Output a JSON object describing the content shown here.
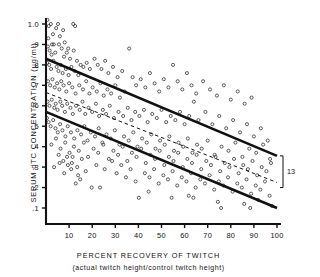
{
  "figure": {
    "type": "scatter-with-regression",
    "background": "#ffffff",
    "ink_color": "#111111"
  },
  "axes": {
    "y": {
      "title": "SERUM dTC CONCENTRATION (µg/ml)",
      "ticks": [
        "1.0",
        ".9",
        ".8",
        ".7",
        ".6",
        ".5",
        ".4",
        ".3",
        ".2",
        ".1"
      ],
      "tick_values": [
        1.0,
        0.9,
        0.8,
        0.7,
        0.6,
        0.5,
        0.4,
        0.3,
        0.2,
        0.1
      ],
      "min": 0.0,
      "max": 1.05
    },
    "x": {
      "title": "PERCENT RECOVERY OF TWITCH",
      "subtitle": "(actual twitch height/control twitch height)",
      "ticks": [
        "10",
        "20",
        "30",
        "40",
        "50",
        "60",
        "70",
        "80",
        "90",
        "100"
      ],
      "tick_values": [
        10,
        20,
        30,
        40,
        50,
        60,
        70,
        80,
        90,
        100
      ],
      "min": 0,
      "max": 100
    }
  },
  "annotations": {
    "bracket_label": "13"
  },
  "chart_data": {
    "type": "scatter",
    "title": "",
    "xlabel": "PERCENT RECOVERY OF TWITCH",
    "ylabel": "SERUM dTC CONCENTRATION (µg/ml)",
    "xlim": [
      0,
      100
    ],
    "ylim": [
      0,
      1.05
    ],
    "grid": false,
    "legend": "none",
    "marker": "open-circle",
    "lines": [
      {
        "name": "upper-confidence-line",
        "style": "solid",
        "x": [
          0,
          100
        ],
        "y": [
          0.83,
          0.355
        ]
      },
      {
        "name": "regression-line",
        "style": "dashed",
        "x": [
          0,
          100
        ],
        "y": [
          0.665,
          0.225
        ]
      },
      {
        "name": "lower-confidence-line",
        "style": "solid",
        "x": [
          0,
          100
        ],
        "y": [
          0.57,
          0.1
        ]
      }
    ],
    "bracket": {
      "label": "13",
      "x": 100,
      "y_top": 0.355,
      "y_bottom": 0.2
    },
    "points": [
      [
        0.6,
        1.02
      ],
      [
        1.2,
        0.99
      ],
      [
        2.1,
        1.0
      ],
      [
        3.0,
        0.95
      ],
      [
        1.0,
        0.93
      ],
      [
        2.6,
        0.9
      ],
      [
        4.4,
        0.98
      ],
      [
        5.2,
        1.0
      ],
      [
        6.0,
        0.94
      ],
      [
        7.4,
        0.97
      ],
      [
        8.1,
        0.91
      ],
      [
        9.6,
        0.88
      ],
      [
        11.8,
        1.0
      ],
      [
        12.6,
        0.99
      ],
      [
        0.8,
        0.89
      ],
      [
        1.6,
        0.87
      ],
      [
        2.4,
        0.85
      ],
      [
        3.4,
        0.9
      ],
      [
        4.0,
        0.86
      ],
      [
        5.6,
        0.9
      ],
      [
        6.8,
        0.88
      ],
      [
        7.8,
        0.84
      ],
      [
        9.0,
        0.86
      ],
      [
        10.4,
        0.83
      ],
      [
        12.0,
        0.87
      ],
      [
        13.4,
        0.82
      ],
      [
        15.0,
        0.8
      ],
      [
        0.5,
        0.81
      ],
      [
        1.4,
        0.8
      ],
      [
        2.2,
        0.78
      ],
      [
        3.2,
        0.82
      ],
      [
        4.6,
        0.79
      ],
      [
        5.4,
        0.77
      ],
      [
        6.4,
        0.8
      ],
      [
        7.2,
        0.76
      ],
      [
        8.6,
        0.78
      ],
      [
        9.8,
        0.75
      ],
      [
        11.0,
        0.79
      ],
      [
        12.4,
        0.77
      ],
      [
        14.0,
        0.75
      ],
      [
        16.2,
        0.79
      ],
      [
        17.6,
        0.81
      ],
      [
        19.0,
        0.78
      ],
      [
        21.0,
        0.83
      ],
      [
        22.4,
        0.8
      ],
      [
        24.0,
        0.78
      ],
      [
        25.6,
        0.82
      ],
      [
        27.0,
        0.76
      ],
      [
        29.0,
        0.79
      ],
      [
        31.0,
        0.74
      ],
      [
        33.0,
        0.77
      ],
      [
        0.9,
        0.72
      ],
      [
        1.8,
        0.7
      ],
      [
        2.8,
        0.73
      ],
      [
        3.8,
        0.69
      ],
      [
        4.8,
        0.71
      ],
      [
        5.8,
        0.68
      ],
      [
        6.6,
        0.72
      ],
      [
        7.6,
        0.7
      ],
      [
        8.8,
        0.67
      ],
      [
        10.0,
        0.71
      ],
      [
        11.4,
        0.69
      ],
      [
        12.8,
        0.66
      ],
      [
        14.4,
        0.7
      ],
      [
        16.0,
        0.68
      ],
      [
        17.4,
        0.72
      ],
      [
        18.8,
        0.66
      ],
      [
        20.2,
        0.69
      ],
      [
        22.0,
        0.67
      ],
      [
        23.6,
        0.71
      ],
      [
        25.0,
        0.65
      ],
      [
        26.6,
        0.68
      ],
      [
        28.2,
        0.66
      ],
      [
        30.0,
        0.7
      ],
      [
        32.0,
        0.64
      ],
      [
        34.0,
        0.67
      ],
      [
        36.0,
        0.88
      ],
      [
        37.5,
        0.74
      ],
      [
        39.0,
        0.7
      ],
      [
        41.0,
        0.73
      ],
      [
        43.0,
        0.69
      ],
      [
        45.0,
        0.76
      ],
      [
        47.0,
        0.71
      ],
      [
        49.0,
        0.67
      ],
      [
        51.0,
        0.73
      ],
      [
        53.0,
        0.69
      ],
      [
        55.0,
        0.8
      ],
      [
        57.0,
        0.72
      ],
      [
        59.0,
        0.68
      ],
      [
        61.0,
        0.76
      ],
      [
        63.0,
        0.7
      ],
      [
        65.0,
        0.66
      ],
      [
        68.0,
        0.72
      ],
      [
        71.0,
        0.68
      ],
      [
        74.0,
        0.65
      ],
      [
        77.0,
        0.7
      ],
      [
        80.0,
        0.63
      ],
      [
        83.0,
        0.67
      ],
      [
        86.0,
        0.61
      ],
      [
        89.0,
        0.64
      ],
      [
        0.7,
        0.62
      ],
      [
        1.5,
        0.6
      ],
      [
        2.5,
        0.63
      ],
      [
        3.6,
        0.59
      ],
      [
        4.2,
        0.61
      ],
      [
        5.0,
        0.58
      ],
      [
        6.2,
        0.62
      ],
      [
        7.0,
        0.6
      ],
      [
        8.2,
        0.57
      ],
      [
        9.2,
        0.61
      ],
      [
        10.6,
        0.59
      ],
      [
        11.6,
        0.56
      ],
      [
        13.0,
        0.6
      ],
      [
        14.6,
        0.58
      ],
      [
        15.8,
        0.62
      ],
      [
        17.0,
        0.56
      ],
      [
        18.4,
        0.59
      ],
      [
        20.0,
        0.57
      ],
      [
        21.6,
        0.61
      ],
      [
        23.0,
        0.55
      ],
      [
        24.6,
        0.58
      ],
      [
        26.0,
        0.56
      ],
      [
        27.6,
        0.6
      ],
      [
        29.4,
        0.54
      ],
      [
        31.4,
        0.57
      ],
      [
        33.4,
        0.55
      ],
      [
        35.4,
        0.59
      ],
      [
        37.0,
        0.53
      ],
      [
        38.6,
        0.57
      ],
      [
        40.4,
        0.55
      ],
      [
        42.4,
        0.58
      ],
      [
        44.0,
        0.52
      ],
      [
        46.0,
        0.56
      ],
      [
        48.0,
        0.54
      ],
      [
        50.0,
        0.58
      ],
      [
        52.0,
        0.52
      ],
      [
        54.0,
        0.55
      ],
      [
        56.0,
        0.53
      ],
      [
        58.0,
        0.57
      ],
      [
        60.0,
        0.51
      ],
      [
        62.0,
        0.55
      ],
      [
        64.0,
        0.62
      ],
      [
        66.0,
        0.53
      ],
      [
        69.0,
        0.57
      ],
      [
        72.0,
        0.51
      ],
      [
        75.0,
        0.55
      ],
      [
        78.0,
        0.49
      ],
      [
        81.0,
        0.53
      ],
      [
        84.0,
        0.47
      ],
      [
        87.0,
        0.51
      ],
      [
        90.0,
        0.45
      ],
      [
        93.0,
        0.49
      ],
      [
        96.0,
        0.43
      ],
      [
        0.4,
        0.54
      ],
      [
        1.1,
        0.52
      ],
      [
        2.0,
        0.5
      ],
      [
        3.1,
        0.53
      ],
      [
        4.1,
        0.49
      ],
      [
        5.1,
        0.47
      ],
      [
        6.1,
        0.51
      ],
      [
        7.1,
        0.48
      ],
      [
        8.4,
        0.45
      ],
      [
        9.4,
        0.5
      ],
      [
        10.8,
        0.47
      ],
      [
        12.2,
        0.44
      ],
      [
        13.6,
        0.48
      ],
      [
        15.2,
        0.46
      ],
      [
        16.6,
        0.5
      ],
      [
        18.0,
        0.43
      ],
      [
        19.4,
        0.47
      ],
      [
        21.2,
        0.45
      ],
      [
        22.8,
        0.49
      ],
      [
        24.4,
        0.42
      ],
      [
        26.2,
        0.46
      ],
      [
        28.0,
        0.44
      ],
      [
        29.8,
        0.48
      ],
      [
        31.8,
        0.41
      ],
      [
        33.8,
        0.45
      ],
      [
        35.8,
        0.43
      ],
      [
        37.8,
        0.47
      ],
      [
        39.6,
        0.4
      ],
      [
        41.6,
        0.44
      ],
      [
        43.6,
        0.42
      ],
      [
        45.6,
        0.46
      ],
      [
        47.4,
        0.39
      ],
      [
        49.4,
        0.43
      ],
      [
        51.4,
        0.41
      ],
      [
        53.4,
        0.45
      ],
      [
        55.4,
        0.38
      ],
      [
        57.4,
        0.42
      ],
      [
        59.4,
        0.4
      ],
      [
        61.4,
        0.44
      ],
      [
        63.4,
        0.37
      ],
      [
        65.4,
        0.41
      ],
      [
        67.4,
        0.39
      ],
      [
        70.0,
        0.43
      ],
      [
        73.0,
        0.36
      ],
      [
        76.0,
        0.4
      ],
      [
        79.0,
        0.38
      ],
      [
        82.0,
        0.42
      ],
      [
        85.0,
        0.35
      ],
      [
        88.0,
        0.39
      ],
      [
        91.0,
        0.37
      ],
      [
        94.0,
        0.41
      ],
      [
        97.0,
        0.34
      ],
      [
        2.3,
        0.41
      ],
      [
        4.3,
        0.44
      ],
      [
        6.3,
        0.39
      ],
      [
        8.3,
        0.42
      ],
      [
        10.2,
        0.37
      ],
      [
        12.1,
        0.4
      ],
      [
        14.2,
        0.38
      ],
      [
        16.4,
        0.42
      ],
      [
        18.2,
        0.35
      ],
      [
        20.6,
        0.39
      ],
      [
        22.6,
        0.37
      ],
      [
        24.8,
        0.41
      ],
      [
        27.2,
        0.34
      ],
      [
        29.2,
        0.38
      ],
      [
        31.2,
        0.36
      ],
      [
        33.2,
        0.4
      ],
      [
        35.2,
        0.33
      ],
      [
        37.2,
        0.37
      ],
      [
        39.2,
        0.35
      ],
      [
        41.2,
        0.39
      ],
      [
        43.2,
        0.32
      ],
      [
        45.2,
        0.36
      ],
      [
        47.2,
        0.34
      ],
      [
        49.2,
        0.38
      ],
      [
        51.2,
        0.31
      ],
      [
        53.2,
        0.35
      ],
      [
        55.2,
        0.33
      ],
      [
        57.2,
        0.37
      ],
      [
        59.2,
        0.3
      ],
      [
        61.2,
        0.34
      ],
      [
        63.2,
        0.32
      ],
      [
        65.2,
        0.36
      ],
      [
        67.2,
        0.29
      ],
      [
        69.4,
        0.33
      ],
      [
        71.4,
        0.31
      ],
      [
        73.4,
        0.35
      ],
      [
        75.4,
        0.28
      ],
      [
        77.4,
        0.32
      ],
      [
        79.4,
        0.3
      ],
      [
        81.4,
        0.34
      ],
      [
        83.4,
        0.27
      ],
      [
        85.4,
        0.31
      ],
      [
        87.4,
        0.29
      ],
      [
        89.4,
        0.33
      ],
      [
        91.4,
        0.26
      ],
      [
        93.4,
        0.3
      ],
      [
        95.4,
        0.28
      ],
      [
        97.4,
        0.32
      ],
      [
        5.5,
        0.36
      ],
      [
        7.5,
        0.33
      ],
      [
        9.5,
        0.31
      ],
      [
        11.5,
        0.35
      ],
      [
        13.5,
        0.3
      ],
      [
        15.5,
        0.34
      ],
      [
        19.8,
        0.2
      ],
      [
        21.8,
        0.31
      ],
      [
        25.4,
        0.29
      ],
      [
        28.6,
        0.33
      ],
      [
        30.6,
        0.27
      ],
      [
        32.6,
        0.31
      ],
      [
        34.6,
        0.25
      ],
      [
        36.6,
        0.29
      ],
      [
        38.8,
        0.23
      ],
      [
        40.2,
        0.15
      ],
      [
        42.8,
        0.27
      ],
      [
        44.8,
        0.25
      ],
      [
        46.8,
        0.29
      ],
      [
        48.8,
        0.22
      ],
      [
        50.8,
        0.26
      ],
      [
        52.8,
        0.24
      ],
      [
        54.8,
        0.28
      ],
      [
        56.8,
        0.21
      ],
      [
        58.8,
        0.25
      ],
      [
        60.8,
        0.23
      ],
      [
        62.8,
        0.27
      ],
      [
        64.8,
        0.2
      ],
      [
        66.8,
        0.24
      ],
      [
        68.8,
        0.22
      ],
      [
        70.8,
        0.26
      ],
      [
        72.8,
        0.19
      ],
      [
        74.8,
        0.23
      ],
      [
        76.8,
        0.21
      ],
      [
        78.8,
        0.25
      ],
      [
        80.8,
        0.18
      ],
      [
        82.8,
        0.22
      ],
      [
        84.8,
        0.2
      ],
      [
        86.8,
        0.24
      ],
      [
        88.8,
        0.17
      ],
      [
        90.8,
        0.21
      ],
      [
        92.8,
        0.19
      ],
      [
        94.8,
        0.23
      ],
      [
        96.8,
        0.16
      ],
      [
        7.9,
        0.27
      ],
      [
        10.9,
        0.29
      ],
      [
        13.9,
        0.26
      ],
      [
        17.2,
        0.28
      ],
      [
        23.4,
        0.2
      ],
      [
        44.4,
        0.18
      ],
      [
        54.4,
        0.15
      ],
      [
        61.8,
        0.16
      ],
      [
        63.8,
        0.15
      ],
      [
        74.4,
        0.13
      ],
      [
        75.8,
        0.1
      ],
      [
        85.8,
        0.12
      ],
      [
        88.4,
        0.1
      ],
      [
        91.8,
        0.14
      ],
      [
        97.8,
        0.11
      ],
      [
        3.5,
        0.3
      ],
      [
        5.9,
        0.32
      ],
      [
        9.1,
        0.35
      ],
      [
        11.2,
        0.32
      ],
      [
        14.8,
        0.24
      ],
      [
        12.9,
        0.22
      ]
    ]
  }
}
